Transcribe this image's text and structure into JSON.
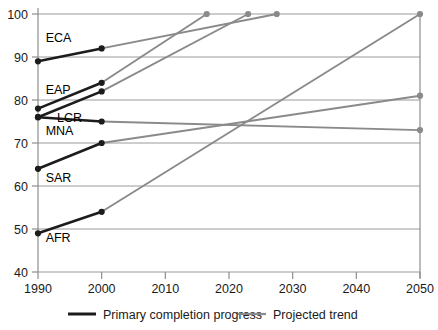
{
  "chart_data": {
    "type": "line",
    "title": "",
    "xlabel": "",
    "ylabel": "",
    "xlim": [
      1990,
      2050
    ],
    "ylim": [
      40,
      100
    ],
    "x_ticks": [
      1990,
      2000,
      2010,
      2020,
      2030,
      2040,
      2050
    ],
    "y_ticks": [
      40,
      50,
      60,
      70,
      80,
      90,
      100
    ],
    "grid": "horizontal",
    "legend_position": "bottom",
    "legend": [
      {
        "name": "Primary completion progress",
        "color": "#1c1c1c"
      },
      {
        "name": "Projected trend",
        "color": "#8a8a8a"
      }
    ],
    "series": [
      {
        "name": "ECA",
        "label": "ECA",
        "progress": {
          "x": [
            1990,
            2000
          ],
          "y": [
            89,
            92
          ]
        },
        "projected": {
          "x": [
            2000,
            2027.5
          ],
          "y": [
            92,
            100
          ]
        }
      },
      {
        "name": "EAP",
        "label": "EAP",
        "progress": {
          "x": [
            1990,
            2000
          ],
          "y": [
            78,
            84
          ]
        },
        "projected": {
          "x": [
            2000,
            2016.5
          ],
          "y": [
            84,
            100
          ]
        }
      },
      {
        "name": "LCR",
        "label": "LCR",
        "progress": {
          "x": [
            1990,
            2000
          ],
          "y": [
            76,
            82
          ]
        },
        "projected": {
          "x": [
            2000,
            2023
          ],
          "y": [
            82,
            100
          ]
        }
      },
      {
        "name": "MNA",
        "label": "MNA",
        "progress": {
          "x": [
            1990,
            2000
          ],
          "y": [
            76,
            75
          ]
        },
        "projected": {
          "x": [
            2000,
            2050
          ],
          "y": [
            75,
            73
          ]
        }
      },
      {
        "name": "SAR",
        "label": "SAR",
        "progress": {
          "x": [
            1990,
            2000
          ],
          "y": [
            64,
            70
          ]
        },
        "projected": {
          "x": [
            2000,
            2050
          ],
          "y": [
            70,
            81
          ]
        }
      },
      {
        "name": "AFR",
        "label": "AFR",
        "progress": {
          "x": [
            1990,
            2000
          ],
          "y": [
            49,
            54
          ]
        },
        "projected": {
          "x": [
            2000,
            2050
          ],
          "y": [
            54,
            100
          ]
        }
      }
    ],
    "series_label_positions": [
      {
        "name": "ECA",
        "x": 1991.2,
        "y": 93.5
      },
      {
        "name": "EAP",
        "x": 1991.2,
        "y": 81.5
      },
      {
        "name": "LCR",
        "x": 1993.0,
        "y": 75.0
      },
      {
        "name": "MNA",
        "x": 1991.2,
        "y": 71.8
      },
      {
        "name": "SAR",
        "x": 1991.2,
        "y": 61.0
      },
      {
        "name": "AFR",
        "x": 1991.2,
        "y": 47.0
      }
    ]
  }
}
